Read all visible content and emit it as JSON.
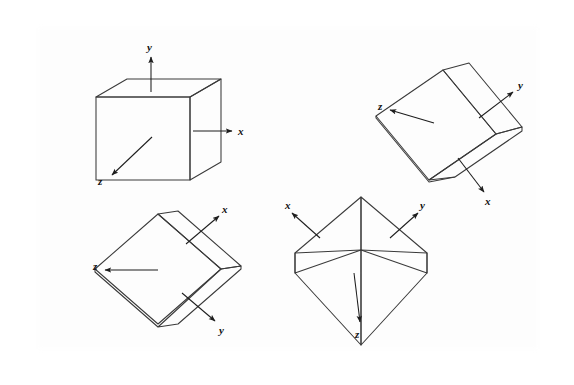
{
  "document": {
    "kind": "scanned-figure",
    "background_color": "#ffffff",
    "border_color": "#9a9a9a",
    "line_color": "#2b2b2b"
  },
  "figure": {
    "title": "",
    "caption": "",
    "cube_count": 4,
    "cubes": [
      {
        "id": "cube-front-view",
        "position": "top-left",
        "description": "Cube viewed face-on with x to the right, y up, z toward viewer",
        "labels": {
          "x": "x",
          "y": "y",
          "z": "z"
        },
        "axes": [
          {
            "name": "x",
            "label": "x",
            "direction": "right"
          },
          {
            "name": "y",
            "label": "y",
            "direction": "up"
          },
          {
            "name": "z",
            "label": "z",
            "direction": "down-left"
          }
        ]
      },
      {
        "id": "cube-rotated-upper-right",
        "position": "top-right",
        "description": "Cube rotated so the top face tilts; y points up-right, x points down-right, z points left",
        "labels": {
          "x": "x",
          "y": "y",
          "z": "z"
        },
        "axes": [
          {
            "name": "y",
            "label": "y",
            "direction": "up-right"
          },
          {
            "name": "x",
            "label": "x",
            "direction": "down-right"
          },
          {
            "name": "z",
            "label": "z",
            "direction": "left"
          }
        ]
      },
      {
        "id": "cube-rotated-lower-left",
        "position": "bottom-left",
        "description": "Cube rotated on a diagonal; x points up-right, y points down-right, z points left",
        "labels": {
          "x": "x",
          "y": "y",
          "z": "z"
        },
        "axes": [
          {
            "name": "x",
            "label": "x",
            "direction": "up-right"
          },
          {
            "name": "y",
            "label": "y",
            "direction": "down-right"
          },
          {
            "name": "z",
            "label": "z",
            "direction": "left"
          }
        ]
      },
      {
        "id": "cube-corner-on-lower-right",
        "position": "bottom-right",
        "description": "Cube viewed corner-on with two top faces visible; x points up-left, y points up-right, z points down",
        "labels": {
          "x": "x",
          "y": "y",
          "z": "z"
        },
        "axes": [
          {
            "name": "x",
            "label": "x",
            "direction": "up-left"
          },
          {
            "name": "y",
            "label": "y",
            "direction": "up-right"
          },
          {
            "name": "z",
            "label": "z",
            "direction": "down"
          }
        ]
      }
    ]
  },
  "labels": {
    "c1_x": "x",
    "c1_y": "y",
    "c1_z": "z",
    "c2_x": "x",
    "c2_y": "y",
    "c2_z": "z",
    "c3_x": "x",
    "c3_y": "y",
    "c3_z": "z",
    "c4_x": "x",
    "c4_y": "y",
    "c4_z": "z"
  }
}
